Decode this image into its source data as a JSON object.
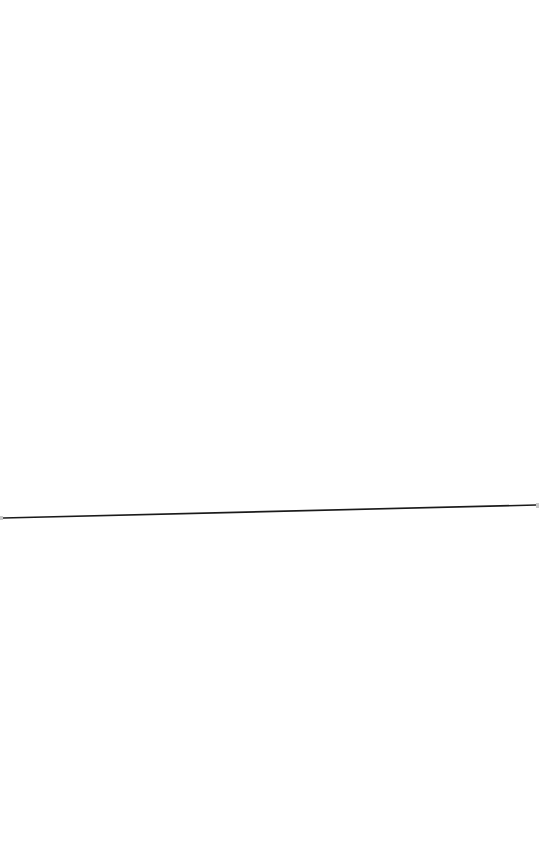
{
  "canvas": {
    "width": 539,
    "height": 864,
    "background": "#ffffff"
  },
  "line": {
    "x1": 3,
    "y1": 518,
    "x2": 536,
    "y2": 505,
    "color": "#1a1a1a",
    "stroke_width": 1.6,
    "endpoint_color": "#c8c8c8"
  }
}
